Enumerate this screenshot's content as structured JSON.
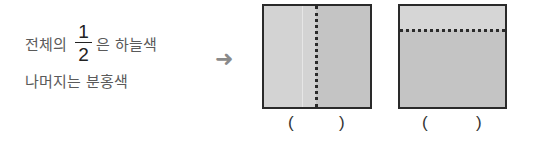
{
  "statement": {
    "line1_prefix": "전체의",
    "fraction": {
      "numerator": "1",
      "denominator": "2"
    },
    "line1_suffix": "은 하늘색",
    "line2": "나머지는 분홍색"
  },
  "arrow": {
    "icon": "right-arrow-icon",
    "glyph": "➜"
  },
  "figures": [
    {
      "id": "square-vertical-split",
      "divider": "vertical-dotted",
      "answer_open": "(",
      "answer_close": ")"
    },
    {
      "id": "square-horizontal-split",
      "divider": "horizontal-dotted",
      "answer_open": "(",
      "answer_close": ")"
    }
  ],
  "colors": {
    "text": "#5a5a5a",
    "fraction": "#222222",
    "border": "#2a2a2a",
    "light_fill": "#d3d3d3",
    "dark_fill": "#c4c4c4",
    "arrow": "#8a8a8a"
  }
}
